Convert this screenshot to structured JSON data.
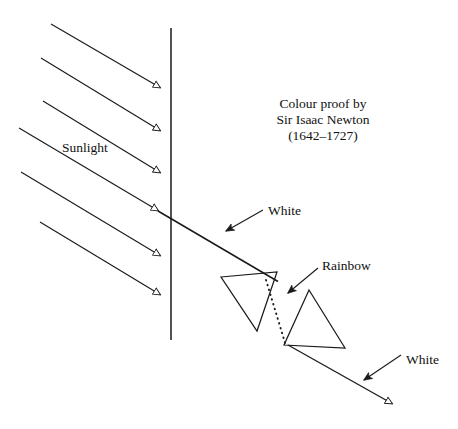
{
  "figure": {
    "width": 458,
    "height": 429,
    "background_color": "#ffffff",
    "stroke_color": "#1a1a1a"
  },
  "caption": {
    "line1": "Colour proof by",
    "line2": "Sir Isaac Newton",
    "line3": "(1642–1727)"
  },
  "labels": {
    "sunlight": "Sunlight",
    "white_top": "White",
    "rainbow": "Rainbow",
    "white_bottom": "White"
  },
  "diagram_data": {
    "type": "diagram",
    "description": "Optics ray diagram: six parallel sunlight rays strike a vertical barrier; one ray passes through as white light into a pair of prisms, dispersing into a rainbow and recombining into white light.",
    "barrier": {
      "name": "vertical-barrier-line",
      "x": 171,
      "y_top": 28,
      "y_bottom": 340
    },
    "sunlight_rays": [
      {
        "x1": 51,
        "y1": 24,
        "x2": 161,
        "y2": 88
      },
      {
        "x1": 41,
        "y1": 58,
        "x2": 161,
        "y2": 131
      },
      {
        "x1": 43,
        "y1": 101,
        "x2": 161,
        "y2": 173
      },
      {
        "x1": 19,
        "y1": 128,
        "x2": 159,
        "y2": 211
      },
      {
        "x1": 21,
        "y1": 172,
        "x2": 161,
        "y2": 256
      },
      {
        "x1": 40,
        "y1": 222,
        "x2": 161,
        "y2": 295
      }
    ],
    "white_beam_in": {
      "x1": 159,
      "y1": 211,
      "x2": 277,
      "y2": 281
    },
    "white_beam_out": {
      "x1": 288,
      "y1": 345,
      "x2": 393,
      "y2": 404
    },
    "prism_one": {
      "name": "inverted-prism",
      "points": "221,277 277,272 257,331"
    },
    "prism_two": {
      "name": "upright-prism",
      "points": "309,290 345,348 284,345"
    },
    "rainbow_dotted_ray": {
      "x1": 266,
      "y1": 280,
      "x2": 286,
      "y2": 346
    },
    "annotation_arrows": [
      {
        "name": "white-top-arrow",
        "x1": 263,
        "y1": 210,
        "x2": 224,
        "y2": 232
      },
      {
        "name": "rainbow-arrow",
        "x1": 318,
        "y1": 268,
        "x2": 286,
        "y2": 294
      },
      {
        "name": "white-bottom-arrow",
        "x1": 401,
        "y1": 355,
        "x2": 362,
        "y2": 381
      }
    ]
  }
}
